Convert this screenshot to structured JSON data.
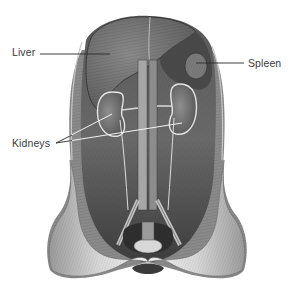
{
  "figure": {
    "style": "engraving",
    "colors": {
      "background": "#ffffff",
      "cavity_dark": "#4a4a4a",
      "cavity_mid": "#6e6e6e",
      "tissue_light": "#b8b8b8",
      "skin_light": "#e2e2e2",
      "label_text": "#3a3a3a",
      "leader_line": "#2a2a2a",
      "highlight": "#f2f2f2"
    }
  },
  "labels": {
    "liver": "Liver",
    "spleen": "Spleen",
    "kidneys": "Kidneys"
  }
}
